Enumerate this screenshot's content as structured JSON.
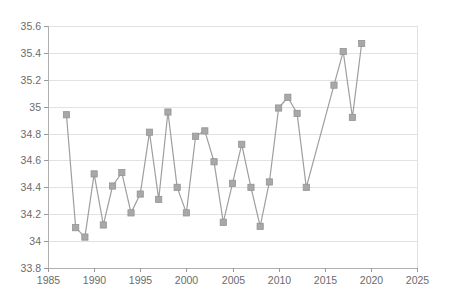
{
  "chart_data": {
    "type": "line",
    "title": "",
    "subtitle": "",
    "xlabel": "",
    "ylabel": "",
    "xlim": [
      1985,
      2025
    ],
    "ylim": [
      33.8,
      35.6
    ],
    "grid": true,
    "legend": false,
    "legend_position": "none",
    "marker": "square",
    "series_color": "#a8a8a8",
    "line_color": "#9e9e9e",
    "gridline_color": "#e2e2e2",
    "axis_color": "#b0b0b0",
    "tick_label_color": "#6b6b6b",
    "background_color": "#ffffff",
    "x_ticks": [
      1985,
      1990,
      1995,
      2000,
      2005,
      2010,
      2015,
      2020,
      2025
    ],
    "x_tick_labels": [
      "1985",
      "1990",
      "1995",
      "2000",
      "2005",
      "2010",
      "2015",
      "2020",
      "2025"
    ],
    "y_ticks": [
      33.8,
      34,
      34.2,
      34.4,
      34.6,
      34.8,
      35,
      35.2,
      35.4,
      35.6
    ],
    "y_tick_labels": [
      "33.8",
      "34",
      "34.2",
      "34.4",
      "34.6",
      "34.8",
      "35",
      "35.2",
      "35.4",
      "35.6"
    ],
    "x": [
      1987,
      1988,
      1989,
      1990,
      1991,
      1992,
      1993,
      1994,
      1995,
      1996,
      1997,
      1998,
      1999,
      2000,
      2001,
      2002,
      2003,
      2004,
      2005,
      2006,
      2007,
      2008,
      2009,
      2010,
      2011,
      2012,
      2013,
      2016,
      2017,
      2018,
      2019
    ],
    "values": [
      34.94,
      34.1,
      34.03,
      34.5,
      34.12,
      34.41,
      34.51,
      34.21,
      34.35,
      34.81,
      34.31,
      34.96,
      34.4,
      34.21,
      34.78,
      34.82,
      34.59,
      34.14,
      34.43,
      34.72,
      34.4,
      34.11,
      34.44,
      34.99,
      35.07,
      34.95,
      34.4,
      35.16,
      35.41,
      34.92,
      35.47
    ],
    "series": [
      {
        "name": "series-1",
        "x": [
          1987,
          1988,
          1989,
          1990,
          1991,
          1992,
          1993,
          1994,
          1995,
          1996,
          1997,
          1998,
          1999,
          2000,
          2001,
          2002,
          2003,
          2004,
          2005,
          2006,
          2007,
          2008,
          2009,
          2010,
          2011,
          2012,
          2013,
          2016,
          2017,
          2018,
          2019
        ],
        "values": [
          34.94,
          34.1,
          34.03,
          34.5,
          34.12,
          34.41,
          34.51,
          34.21,
          34.35,
          34.81,
          34.31,
          34.96,
          34.4,
          34.21,
          34.78,
          34.82,
          34.59,
          34.14,
          34.43,
          34.72,
          34.4,
          34.11,
          34.44,
          34.99,
          35.07,
          34.95,
          34.4,
          35.16,
          35.41,
          34.92,
          35.47
        ]
      }
    ]
  }
}
